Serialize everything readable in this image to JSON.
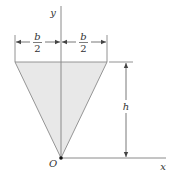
{
  "figure": {
    "type": "triangle-area-diagram",
    "shape": "inverted isosceles triangle with vertex at origin",
    "fill_color": "#e6e6e6",
    "line_color": "#888888",
    "axes": {
      "x_label": "x",
      "y_label": "y",
      "origin_label": "O"
    },
    "dimensions": {
      "left_half_width": {
        "numerator": "b",
        "denominator": "2"
      },
      "right_half_width": {
        "numerator": "b",
        "denominator": "2"
      },
      "height": "h"
    }
  }
}
